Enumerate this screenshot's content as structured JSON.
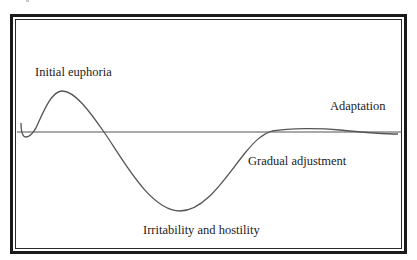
{
  "diagram": {
    "type": "line-curve",
    "labels": {
      "initial_euphoria": "Initial euphoria",
      "adaptation": "Adaptation",
      "gradual_adjustment": "Gradual adjustment",
      "irritability_and_hostility": "Irritability and hostility"
    },
    "colors": {
      "line": "#555555",
      "baseline": "#555555",
      "frame": "#1a1a1a",
      "text": "#222222",
      "background": "#ffffff"
    },
    "stages": [
      {
        "name": "Initial euphoria",
        "phase": "peak above baseline"
      },
      {
        "name": "Irritability and hostility",
        "phase": "trough below baseline"
      },
      {
        "name": "Gradual adjustment",
        "phase": "rising toward baseline"
      },
      {
        "name": "Adaptation",
        "phase": "stable near baseline"
      }
    ]
  }
}
